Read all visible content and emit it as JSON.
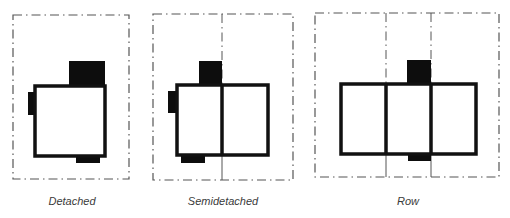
{
  "colors": {
    "outline": "#111111",
    "block": "#0d0d0d",
    "lot_line": "#555555",
    "label": "#3a3a3a",
    "background": "#ffffff"
  },
  "panels": [
    {
      "id": "detached",
      "label": "Detached",
      "lot_frame": {
        "x": 13,
        "y": 15,
        "w": 116,
        "h": 164
      },
      "house": {
        "x": 35,
        "y": 86,
        "w": 70,
        "h": 70
      },
      "party_walls": [],
      "blocks": [
        {
          "x": 69,
          "y": 61,
          "w": 36,
          "h": 25
        },
        {
          "x": 28,
          "y": 92,
          "w": 9,
          "h": 23
        },
        {
          "x": 76,
          "y": 154,
          "w": 24,
          "h": 9
        }
      ],
      "label_pos": {
        "x": 72,
        "y": 195
      }
    },
    {
      "id": "semidetached",
      "label": "Semidetached",
      "lot_frame": {
        "x": 153,
        "y": 14,
        "w": 140,
        "h": 166
      },
      "house": {
        "x": 177,
        "y": 85,
        "w": 91,
        "h": 70
      },
      "party_walls": [
        {
          "x": 222,
          "y1": 14,
          "y2": 180,
          "wall_y1": 85,
          "wall_y2": 155
        }
      ],
      "blocks": [
        {
          "x": 199,
          "y": 61,
          "w": 23,
          "h": 24
        },
        {
          "x": 168,
          "y": 91,
          "w": 10,
          "h": 22
        },
        {
          "x": 181,
          "y": 154,
          "w": 24,
          "h": 9
        }
      ],
      "label_pos": {
        "x": 223,
        "y": 195
      }
    },
    {
      "id": "row",
      "label": "Row",
      "lot_frame": {
        "x": 315,
        "y": 13,
        "w": 184,
        "h": 164
      },
      "house": {
        "x": 341,
        "y": 84,
        "w": 135,
        "h": 70
      },
      "party_walls": [
        {
          "x": 386,
          "y1": 13,
          "y2": 177,
          "wall_y1": 84,
          "wall_y2": 154
        },
        {
          "x": 431,
          "y1": 13,
          "y2": 177,
          "wall_y1": 84,
          "wall_y2": 154
        }
      ],
      "blocks": [
        {
          "x": 407,
          "y": 60,
          "w": 24,
          "h": 24
        },
        {
          "x": 408,
          "y": 153,
          "w": 23,
          "h": 8
        }
      ],
      "label_pos": {
        "x": 408,
        "y": 195
      }
    }
  ]
}
